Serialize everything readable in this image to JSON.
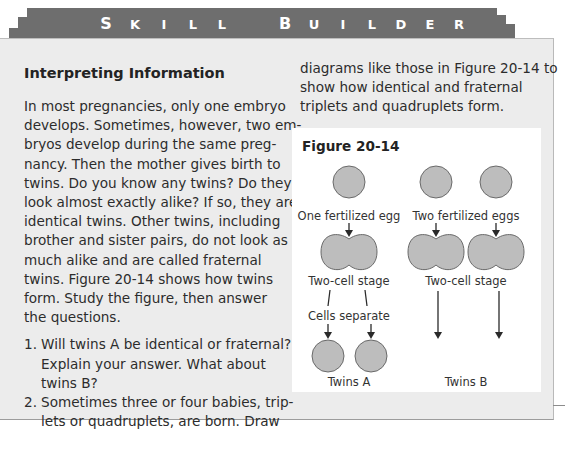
{
  "banner": {
    "words": [
      {
        "letters": [
          "S",
          "K",
          "I",
          "L",
          "L"
        ]
      },
      {
        "letters": [
          "B",
          "U",
          "I",
          "L",
          "D",
          "E",
          "R"
        ]
      }
    ]
  },
  "section": {
    "heading": "Interpreting Information",
    "intro_lines": [
      "In most pregnancies, only one embryo",
      "develops. Sometimes, however, two em-",
      "bryos develop during the same preg-",
      "nancy. Then the mother gives birth to",
      "twins. Do you know any twins? Do they",
      "look almost exactly alike? If so, they are",
      "identical twins. Other twins, including",
      "brother and sister pairs, do not look as",
      "much alike and are called fraternal",
      "twins. Figure 20-14 shows how twins",
      "form. Study the figure, then answer",
      "the questions."
    ],
    "questions": [
      {
        "number": "1.",
        "lines": [
          "Will twins A be identical or fraternal?",
          "Explain your answer. What about",
          "twins B?"
        ]
      },
      {
        "number": "2.",
        "lines": [
          "Sometimes three or four babies, trip-",
          "lets or quadruplets, are born. Draw"
        ]
      }
    ],
    "continuation_lines": [
      "diagrams like those in Figure 20-14 to",
      "show how identical and fraternal",
      "triplets and quadruplets form."
    ]
  },
  "figure": {
    "title": "Figure 20-14",
    "labels": {
      "one_egg": "One fertilized egg",
      "two_eggs": "Two fertilized eggs",
      "two_cell_a": "Two-cell stage",
      "two_cell_b": "Two-cell stage",
      "cells_separate": "Cells separate",
      "twins_a": "Twins A",
      "twins_b": "Twins B"
    },
    "colors": {
      "cell_fill": "#bdbdbd",
      "cell_stroke": "#6a6a6a",
      "arrow": "#2a2a2a"
    }
  }
}
